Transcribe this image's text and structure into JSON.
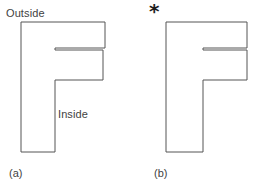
{
  "page": {
    "background_color": "#ffffff",
    "width": 263,
    "height": 189
  },
  "style": {
    "stroke_color": "#555555",
    "fill_color": "#ffffff",
    "text_color": "#3f3f3f",
    "marker_color": "#1d1d1d",
    "stroke_width": 1
  },
  "figure_a": {
    "caption": "(a)",
    "shape_name": "letter-F-outline",
    "annotations": {
      "outside_label": "Outside",
      "inside_label": "Inside"
    },
    "polygon_points": "21,22 105,22 105,48 55,48 55,50 103,50 103,80 55,80 55,152 21,152"
  },
  "figure_b": {
    "caption": "(b)",
    "shape_name": "letter-F-outline",
    "marker": "*",
    "marker_name": "asterisk-marker",
    "polygon_points": "166,22 247,22 247,48 203,48 203,50 247,50 247,80 203,80 203,152 166,152"
  }
}
